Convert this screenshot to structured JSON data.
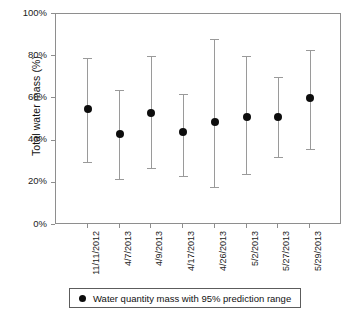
{
  "chart_data": {
    "type": "scatter",
    "title": "",
    "xlabel": "",
    "ylabel": "Total water mass (%)",
    "ylim": [
      0,
      100
    ],
    "yticks": [
      "0%",
      "20%",
      "40%",
      "60%",
      "80%",
      "100%"
    ],
    "ytick_values": [
      0,
      20,
      40,
      60,
      80,
      100
    ],
    "grid": false,
    "legend_position": "bottom",
    "categories": [
      "11/11/2012",
      "4/7/2013",
      "4/9/2013",
      "4/17/2013",
      "4/26/2013",
      "5/2/2013",
      "5/27/2013",
      "5/29/2013"
    ],
    "series": [
      {
        "name": "Water quantity mass  with 95% prediction range",
        "values": [
          55,
          43,
          53,
          44,
          49,
          51,
          51,
          60
        ],
        "lower": [
          30,
          22,
          27,
          23,
          18,
          24,
          32,
          36
        ],
        "upper": [
          79,
          64,
          80,
          62,
          88,
          80,
          70,
          83
        ]
      }
    ],
    "annotations": []
  },
  "axis": {
    "y_title": "Total water mass (%)"
  },
  "legend": {
    "marker": "filled-circle",
    "label": "Water quantity mass  with 95% prediction range"
  },
  "colors": {
    "marker": "#0d0d0d",
    "errorbar": "#9a9a9a",
    "frame": "#8e8e8e",
    "text": "#111111",
    "background": "#ffffff"
  }
}
